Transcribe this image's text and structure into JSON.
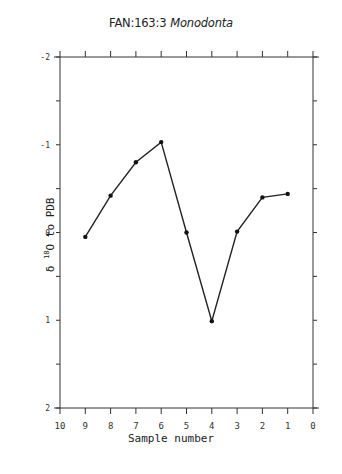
{
  "chart_data": {
    "type": "line",
    "title": "FAN:163:3",
    "title_species": "Monodonta",
    "xlabel": "Sample number",
    "ylabel_prefix": "δ ",
    "ylabel_sup": "18",
    "ylabel_suffix": "O to PDB",
    "xlim": [
      10,
      0
    ],
    "ylim": [
      -2,
      2
    ],
    "y_inverted": true,
    "x_ticks": [
      "10",
      "9",
      "8",
      "7",
      "6",
      "5",
      "4",
      "3",
      "2",
      "1",
      "0"
    ],
    "y_ticks": [
      "-2",
      "-1",
      "0",
      "1",
      "2"
    ],
    "grid": false,
    "series": [
      {
        "name": "Monodonta",
        "x": [
          9,
          8,
          7,
          6,
          5,
          4,
          3,
          2,
          1
        ],
        "values": [
          0.05,
          -0.42,
          -0.8,
          -1.03,
          0.0,
          1.01,
          -0.01,
          -0.4,
          -0.44
        ]
      }
    ]
  }
}
